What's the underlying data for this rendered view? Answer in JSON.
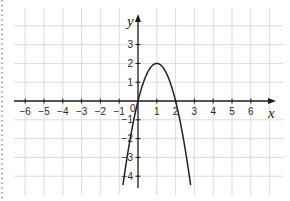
{
  "chart_data": {
    "type": "line",
    "title": "",
    "xlabel": "x",
    "ylabel": "y",
    "function": "y = -2x^2 + 4x",
    "vertex": [
      1,
      2
    ],
    "roots": [
      0,
      2
    ],
    "x_ticks": [
      -6,
      -5,
      -4,
      -3,
      -2,
      -1,
      1,
      2,
      3,
      4,
      5,
      6
    ],
    "x_tick_labels": [
      "−6",
      "−5",
      "−4",
      "−3",
      "−2",
      "−1",
      "1",
      "2",
      "3",
      "4",
      "5",
      "6"
    ],
    "y_ticks": [
      3,
      2,
      1,
      -1,
      -2,
      -3,
      -4
    ],
    "y_tick_labels": [
      "3",
      "2",
      "1",
      "−1",
      "−2",
      "−3",
      "−4"
    ],
    "origin_label": "0",
    "xlim": [
      -6.6,
      7.0
    ],
    "ylim": [
      -4.9,
      4.9
    ],
    "grid": true,
    "series": [
      {
        "name": "parabola",
        "x": [
          -0.8,
          -0.5,
          0,
          0.5,
          1,
          1.5,
          2,
          2.5,
          2.8
        ],
        "values": [
          -4.48,
          -2.5,
          0,
          1.5,
          2,
          1.5,
          0,
          -2.5,
          -4.48
        ]
      }
    ]
  },
  "layout": {
    "origin_px": [
      138,
      101
    ],
    "unit_px": 18.8,
    "grid_x_range_px": [
      14,
      283
    ],
    "grid_y_range_px": [
      8,
      195
    ]
  }
}
